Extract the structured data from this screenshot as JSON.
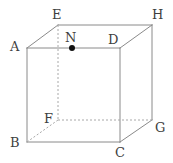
{
  "figure": {
    "kind": "cube-diagram",
    "width": 173,
    "height": 163,
    "background_color": "#ffffff",
    "edge_color": "#8a8a8a",
    "hidden_edge_color": "#a8a8a8",
    "label_color": "#3f3f3f",
    "point_color": "#111111",
    "edge_width": 1,
    "hidden_edge_dash": "2,2"
  },
  "vertices": [
    {
      "id": "A",
      "label": "A",
      "x": 27,
      "y": 48,
      "hidden": false,
      "label_x": 10,
      "label_y": 40
    },
    {
      "id": "B",
      "label": "B",
      "x": 27,
      "y": 142,
      "hidden": false,
      "label_x": 10,
      "label_y": 136
    },
    {
      "id": "C",
      "label": "C",
      "x": 120,
      "y": 142,
      "hidden": false,
      "label_x": 115,
      "label_y": 146
    },
    {
      "id": "D",
      "label": "D",
      "x": 120,
      "y": 48,
      "hidden": false,
      "label_x": 108,
      "label_y": 33
    },
    {
      "id": "E",
      "label": "E",
      "x": 58,
      "y": 25,
      "hidden": false,
      "label_x": 52,
      "label_y": 8
    },
    {
      "id": "F",
      "label": "F",
      "x": 58,
      "y": 120,
      "hidden": true,
      "label_x": 44,
      "label_y": 112
    },
    {
      "id": "G",
      "label": "G",
      "x": 152,
      "y": 120,
      "hidden": false,
      "label_x": 155,
      "label_y": 121
    },
    {
      "id": "H",
      "label": "H",
      "x": 152,
      "y": 25,
      "hidden": false,
      "label_x": 152,
      "label_y": 8
    }
  ],
  "marked_points": [
    {
      "id": "N",
      "label": "N",
      "x": 72,
      "y": 48,
      "radius": 3,
      "label_x": 65,
      "label_y": 31,
      "on_edge": "A-D"
    }
  ],
  "edges_solid": [
    {
      "from": "A",
      "to": "D",
      "x1": 27,
      "y1": 48,
      "x2": 120,
      "y2": 48
    },
    {
      "from": "A",
      "to": "B",
      "x1": 27,
      "y1": 48,
      "x2": 27,
      "y2": 142
    },
    {
      "from": "B",
      "to": "C",
      "x1": 27,
      "y1": 142,
      "x2": 120,
      "y2": 142
    },
    {
      "from": "C",
      "to": "D",
      "x1": 120,
      "y1": 142,
      "x2": 120,
      "y2": 48
    },
    {
      "from": "A",
      "to": "E",
      "x1": 27,
      "y1": 48,
      "x2": 58,
      "y2": 25
    },
    {
      "from": "E",
      "to": "H",
      "x1": 58,
      "y1": 25,
      "x2": 152,
      "y2": 25
    },
    {
      "from": "D",
      "to": "H",
      "x1": 120,
      "y1": 48,
      "x2": 152,
      "y2": 25
    },
    {
      "from": "H",
      "to": "G",
      "x1": 152,
      "y1": 25,
      "x2": 152,
      "y2": 120
    },
    {
      "from": "C",
      "to": "G",
      "x1": 120,
      "y1": 142,
      "x2": 152,
      "y2": 120
    }
  ],
  "edges_hidden": [
    {
      "from": "E",
      "to": "F",
      "x1": 58,
      "y1": 25,
      "x2": 58,
      "y2": 120
    },
    {
      "from": "F",
      "to": "G",
      "x1": 58,
      "y1": 120,
      "x2": 152,
      "y2": 120
    },
    {
      "from": "B",
      "to": "F",
      "x1": 27,
      "y1": 142,
      "x2": 58,
      "y2": 120
    }
  ]
}
